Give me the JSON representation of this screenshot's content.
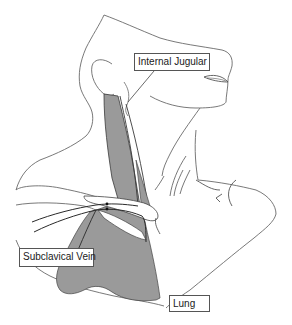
{
  "diagram": {
    "type": "anatomical-illustration",
    "colors": {
      "outline": "#6a6a6a",
      "vessel_fill": "#9a9a9a",
      "vessel_edge": "#3a3a3a",
      "background": "#ffffff",
      "label_border": "#555555"
    },
    "labels": [
      {
        "id": "internal-jugular",
        "text": "Internal Jugular"
      },
      {
        "id": "subclavical-vein",
        "text": "Subclavical Vein"
      },
      {
        "id": "lung",
        "text": "Lung"
      }
    ]
  }
}
